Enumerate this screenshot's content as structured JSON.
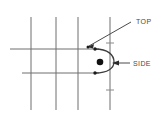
{
  "diagram": {
    "title": "",
    "background_color": "#ffffff",
    "line_color": "#6e6e6e",
    "dark_line_color": "#4a4a4a",
    "dot_color": "#111111",
    "labels": [
      {
        "id": "top",
        "text": "TOP",
        "x": 136,
        "y": 21
      },
      {
        "id": "side",
        "text": "SIDE",
        "x": 133,
        "y": 66
      }
    ],
    "vertical_lines": [
      {
        "id": "grid-vertical-1",
        "x": 31,
        "y1": 17,
        "y2": 110
      },
      {
        "id": "grid-vertical-2",
        "x": 56,
        "y1": 17,
        "y2": 110
      },
      {
        "id": "grid-vertical-3",
        "x": 78,
        "y1": 17,
        "y2": 110
      },
      {
        "id": "grid-vertical-4",
        "x": 110,
        "y1": 17,
        "y2": 110
      }
    ],
    "horizontal_lines": [
      {
        "id": "grid-horizontal-upper",
        "y": 49,
        "x1": 10,
        "x2": 99
      },
      {
        "id": "grid-horizontal-lower",
        "y": 73,
        "x1": 22,
        "x2": 99
      }
    ],
    "curve": {
      "id": "rounded-nose-curve",
      "description": "U-shaped rounded end opening to the left",
      "top_point": {
        "x": 95,
        "y": 49
      },
      "bottom_point": {
        "x": 95,
        "y": 73
      },
      "apex_x": 112
    },
    "center_dot": {
      "id": "center-point",
      "x": 100,
      "y": 62,
      "radius": 3.2
    },
    "curve_end_dots": [
      {
        "id": "curve-dot-top",
        "x": 95,
        "y": 49,
        "radius": 1.6
      },
      {
        "id": "curve-dot-bottom",
        "x": 95,
        "y": 73,
        "radius": 1.6
      }
    ],
    "tick_marks": [
      {
        "id": "tick-upper",
        "x": 110,
        "y": 43
      },
      {
        "id": "tick-lower",
        "x": 110,
        "y": 90
      }
    ],
    "leaders": [
      {
        "id": "top-leader",
        "from": {
          "x": 131,
          "y": 22
        },
        "to": {
          "x": 88,
          "y": 46
        },
        "arrow_at": "to"
      },
      {
        "id": "side-leader",
        "from": {
          "x": 130,
          "y": 63
        },
        "to": {
          "x": 113,
          "y": 63
        },
        "arrow_at": "to"
      }
    ]
  }
}
